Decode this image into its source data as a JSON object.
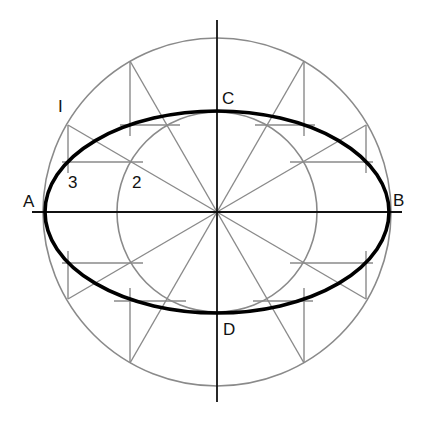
{
  "diagram": {
    "center": {
      "x": 217,
      "y": 212
    },
    "outer_circle_radius": 174,
    "inner_circle_radius": 100,
    "ellipse": {
      "rx": 172,
      "ry": 101
    },
    "radial_angles_deg": [
      30,
      60,
      120,
      150,
      210,
      240,
      300,
      330
    ],
    "colors": {
      "construction": "#8a8a8a",
      "ellipse": "#000000",
      "axis": "#111111"
    },
    "labels": {
      "A": "A",
      "B": "B",
      "C": "C",
      "D": "D",
      "one": "I",
      "two": "2",
      "three": "3"
    }
  }
}
